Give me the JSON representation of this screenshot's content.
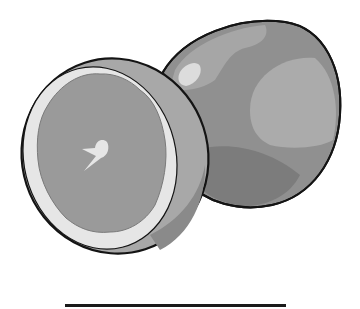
{
  "illustration": {
    "subject": "grapefruit",
    "items": [
      {
        "name": "half-grapefruit",
        "view": "cut-face"
      },
      {
        "name": "whole-grapefruit",
        "view": "peel"
      }
    ],
    "colors": {
      "outline": "#141414",
      "pulp": "#9a9a9a",
      "pith": "#e6e6e6",
      "rind_side": "#a8a8a8",
      "peel_base": "#909090",
      "peel_light": "#b0b0b0",
      "peel_dark": "#7c7c7c",
      "highlight": "#dcdcdc"
    }
  },
  "answer_line": {
    "label": ""
  }
}
